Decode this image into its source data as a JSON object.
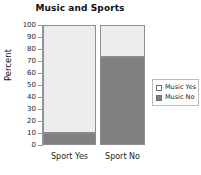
{
  "chart_data": {
    "type": "bar",
    "subtype": "stacked-percent",
    "title": "Music and Sports",
    "xlabel": "",
    "ylabel": "Percent",
    "categories": [
      "Sport Yes",
      "Sport No"
    ],
    "series": [
      {
        "name": "Music Yes",
        "values": [
          90,
          27
        ],
        "color": "#ededed"
      },
      {
        "name": "Music No",
        "values": [
          10,
          73
        ],
        "color": "#808080"
      }
    ],
    "ylim": [
      0,
      100
    ],
    "ytick_labels": [
      "100",
      "90",
      "80",
      "70",
      "60",
      "50",
      "40",
      "30",
      "20",
      "10",
      "0"
    ],
    "ytick_values": [
      100,
      90,
      80,
      70,
      60,
      50,
      40,
      30,
      20,
      10,
      0
    ],
    "grid": false,
    "legend_position": "right",
    "legend": [
      {
        "label": "Music Yes",
        "swatch": "light"
      },
      {
        "label": "Music No",
        "swatch": "dark"
      }
    ],
    "stack_order": [
      "Music Yes",
      "Music No"
    ],
    "axis_color": "#9a9a9a",
    "background": "#ffffff"
  }
}
